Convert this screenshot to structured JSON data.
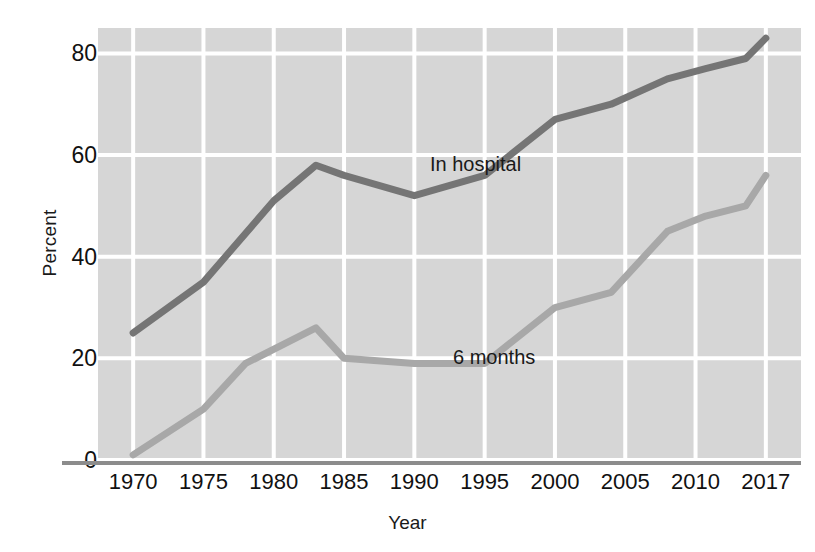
{
  "chart_data": {
    "type": "line",
    "title": "",
    "subtitle": "",
    "xlabel": "Year",
    "ylabel": "Percent",
    "xlim": [
      1970,
      2017
    ],
    "ylim": [
      0,
      85
    ],
    "grid": true,
    "legend_position": "inline-annotations",
    "x_tick_labels": [
      "1970",
      "1975",
      "1980",
      "1985",
      "1990",
      "1995",
      "2000",
      "2005",
      "2010",
      "2017"
    ],
    "x_tick_values": [
      1970,
      1975,
      1980,
      1985,
      1990,
      1995,
      2000,
      2005,
      2010,
      2017
    ],
    "y_tick_labels": [
      "0",
      "20",
      "40",
      "60",
      "80"
    ],
    "y_tick_values": [
      0,
      20,
      40,
      60,
      80
    ],
    "series": [
      {
        "name": "In hospital",
        "color": "#757575",
        "x": [
          1970,
          1975,
          1980,
          1983,
          1985,
          1990,
          1995,
          2000,
          2004,
          2008,
          2011,
          2015,
          2017
        ],
        "values": [
          25,
          35,
          51,
          58,
          56,
          52,
          56,
          67,
          70,
          75,
          77,
          79,
          83
        ]
      },
      {
        "name": "6 months",
        "color": "#a8a8a8",
        "x": [
          1970,
          1975,
          1978,
          1983,
          1985,
          1990,
          1995,
          2000,
          2004,
          2008,
          2011,
          2015,
          2017
        ],
        "values": [
          1,
          10,
          19,
          26,
          20,
          19,
          19,
          30,
          33,
          45,
          48,
          50,
          56
        ]
      }
    ],
    "annotations": [
      {
        "text": "In hospital",
        "series": "In hospital"
      },
      {
        "text": "6 months",
        "series": "6 months"
      }
    ]
  },
  "style": {
    "plot_background": "#d6d6d6",
    "gridline_color": "#ffffff",
    "axis_line_color": "#8c8c8c",
    "text_color": "#1a1a1a"
  }
}
